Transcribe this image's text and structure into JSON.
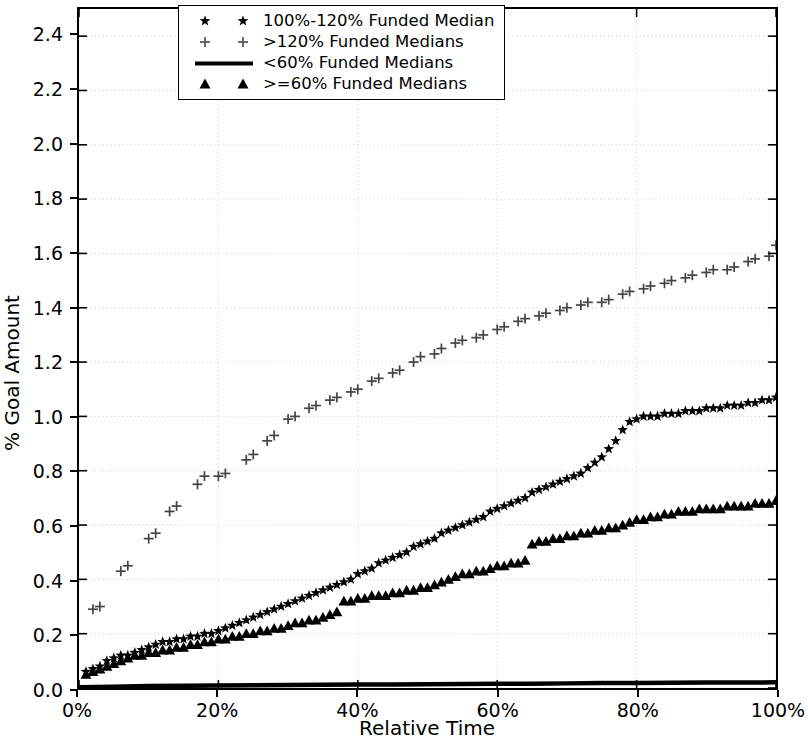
{
  "figure": {
    "width": 808,
    "height": 745,
    "background": "#ffffff",
    "foreground": "#000000",
    "grid_color": "#cccccc"
  },
  "axes": {
    "ylabel": "% Goal Amount",
    "xlabel": "Relative Time",
    "yticks": [
      "0.0",
      "0.2",
      "0.4",
      "0.6",
      "0.8",
      "1.0",
      "1.2",
      "1.4",
      "1.6",
      "1.8",
      "2.0",
      "2.2",
      "2.4"
    ],
    "ytick_values": [
      0.0,
      0.2,
      0.4,
      0.6,
      0.8,
      1.0,
      1.2,
      1.4,
      1.6,
      1.8,
      2.0,
      2.2,
      2.4
    ],
    "xticks": [
      "0%",
      "20%",
      "40%",
      "60%",
      "80%",
      "100%"
    ],
    "xtick_values": [
      0,
      20,
      40,
      60,
      80,
      100
    ],
    "ylim": [
      0.0,
      2.5
    ],
    "xlim": [
      0,
      100
    ]
  },
  "legend": {
    "position": "upper center",
    "border_color": "#000000",
    "entries": [
      {
        "label": "100%-120% Funded Median",
        "marker": "star",
        "numpoints": 2
      },
      {
        "label": ">120% Funded Medians",
        "marker": "plus",
        "numpoints": 2
      },
      {
        "label": "<60% Funded Medians",
        "marker": "line",
        "numpoints": 1
      },
      {
        "label": ">=60% Funded Medians",
        "marker": "triangle",
        "numpoints": 2
      }
    ]
  },
  "chart_data": {
    "type": "scatter",
    "title": "",
    "xlabel": "Relative Time",
    "ylabel": "% Goal Amount",
    "xlim": [
      0,
      100
    ],
    "ylim": [
      0.0,
      2.5
    ],
    "grid": true,
    "legend_position": "upper center",
    "series": [
      {
        "name": "100%-120% Funded Median",
        "marker": "star",
        "color": "#000000",
        "x": [
          1,
          2,
          3,
          4,
          5,
          6,
          7,
          8,
          9,
          10,
          11,
          12,
          13,
          14,
          15,
          16,
          17,
          18,
          19,
          20,
          21,
          22,
          23,
          24,
          25,
          26,
          27,
          28,
          29,
          30,
          31,
          32,
          33,
          34,
          35,
          36,
          37,
          38,
          39,
          40,
          41,
          42,
          43,
          44,
          45,
          46,
          47,
          48,
          49,
          50,
          51,
          52,
          53,
          54,
          55,
          56,
          57,
          58,
          59,
          60,
          61,
          62,
          63,
          64,
          65,
          66,
          67,
          68,
          69,
          70,
          71,
          72,
          73,
          74,
          75,
          76,
          77,
          78,
          79,
          80,
          81,
          82,
          83,
          84,
          85,
          86,
          87,
          88,
          89,
          90,
          91,
          92,
          93,
          94,
          95,
          96,
          97,
          98,
          99,
          100
        ],
        "y": [
          0.06,
          0.07,
          0.08,
          0.1,
          0.11,
          0.12,
          0.12,
          0.13,
          0.14,
          0.15,
          0.16,
          0.17,
          0.17,
          0.18,
          0.18,
          0.19,
          0.19,
          0.2,
          0.2,
          0.21,
          0.22,
          0.23,
          0.24,
          0.25,
          0.26,
          0.27,
          0.28,
          0.29,
          0.3,
          0.31,
          0.32,
          0.33,
          0.34,
          0.35,
          0.36,
          0.37,
          0.38,
          0.39,
          0.4,
          0.42,
          0.43,
          0.44,
          0.46,
          0.47,
          0.48,
          0.49,
          0.5,
          0.52,
          0.53,
          0.54,
          0.55,
          0.57,
          0.58,
          0.59,
          0.6,
          0.61,
          0.62,
          0.63,
          0.65,
          0.66,
          0.67,
          0.68,
          0.69,
          0.7,
          0.72,
          0.73,
          0.74,
          0.75,
          0.76,
          0.77,
          0.78,
          0.79,
          0.81,
          0.83,
          0.85,
          0.88,
          0.91,
          0.95,
          0.98,
          0.99,
          1.0,
          1.0,
          1.0,
          1.01,
          1.01,
          1.01,
          1.02,
          1.02,
          1.02,
          1.03,
          1.03,
          1.03,
          1.04,
          1.04,
          1.04,
          1.05,
          1.05,
          1.06,
          1.06,
          1.07
        ]
      },
      {
        "name": ">120% Funded Medians",
        "marker": "plus",
        "color": "#444444",
        "x": [
          2,
          3,
          6,
          7,
          10,
          11,
          13,
          14,
          17,
          18,
          20,
          21,
          24,
          25,
          27,
          28,
          30,
          31,
          33,
          34,
          36,
          37,
          39,
          40,
          42,
          43,
          45,
          46,
          48,
          49,
          51,
          52,
          54,
          55,
          57,
          58,
          60,
          61,
          63,
          64,
          66,
          67,
          69,
          70,
          72,
          73,
          75,
          76,
          78,
          79,
          81,
          82,
          84,
          85,
          87,
          88,
          90,
          91,
          93,
          94,
          96,
          97,
          99,
          100
        ],
        "y": [
          0.29,
          0.3,
          0.43,
          0.45,
          0.55,
          0.57,
          0.65,
          0.67,
          0.75,
          0.78,
          0.78,
          0.79,
          0.84,
          0.86,
          0.91,
          0.93,
          0.99,
          1.0,
          1.03,
          1.04,
          1.06,
          1.07,
          1.09,
          1.1,
          1.13,
          1.14,
          1.16,
          1.17,
          1.2,
          1.22,
          1.23,
          1.25,
          1.27,
          1.28,
          1.29,
          1.3,
          1.32,
          1.33,
          1.35,
          1.36,
          1.37,
          1.38,
          1.39,
          1.4,
          1.41,
          1.42,
          1.42,
          1.43,
          1.45,
          1.46,
          1.47,
          1.48,
          1.49,
          1.5,
          1.51,
          1.52,
          1.53,
          1.54,
          1.54,
          1.55,
          1.57,
          1.58,
          1.59,
          1.63
        ]
      },
      {
        "name": "<60% Funded Medians",
        "marker": "line",
        "color": "#000000",
        "x": [
          0,
          5,
          10,
          15,
          20,
          25,
          30,
          35,
          40,
          45,
          50,
          55,
          60,
          65,
          70,
          75,
          80,
          85,
          90,
          95,
          100
        ],
        "y": [
          0.003,
          0.005,
          0.007,
          0.008,
          0.009,
          0.01,
          0.011,
          0.012,
          0.013,
          0.013,
          0.014,
          0.015,
          0.016,
          0.016,
          0.017,
          0.018,
          0.018,
          0.019,
          0.02,
          0.02,
          0.021
        ]
      },
      {
        "name": ">=60% Funded Medians",
        "marker": "triangle",
        "color": "#000000",
        "x": [
          1,
          2,
          3,
          4,
          5,
          6,
          7,
          8,
          9,
          10,
          11,
          12,
          13,
          14,
          15,
          16,
          17,
          18,
          19,
          20,
          21,
          22,
          23,
          24,
          25,
          26,
          27,
          28,
          29,
          30,
          31,
          32,
          33,
          34,
          35,
          36,
          37,
          38,
          39,
          40,
          41,
          42,
          43,
          44,
          45,
          46,
          47,
          48,
          49,
          50,
          51,
          52,
          53,
          54,
          55,
          56,
          57,
          58,
          59,
          60,
          61,
          62,
          63,
          64,
          65,
          66,
          67,
          68,
          69,
          70,
          71,
          72,
          73,
          74,
          75,
          76,
          77,
          78,
          79,
          80,
          81,
          82,
          83,
          84,
          85,
          86,
          87,
          88,
          89,
          90,
          91,
          92,
          93,
          94,
          95,
          96,
          97,
          98,
          99,
          100
        ],
        "y": [
          0.05,
          0.06,
          0.07,
          0.08,
          0.09,
          0.1,
          0.11,
          0.12,
          0.12,
          0.13,
          0.13,
          0.14,
          0.14,
          0.15,
          0.15,
          0.16,
          0.16,
          0.17,
          0.17,
          0.18,
          0.18,
          0.19,
          0.19,
          0.2,
          0.2,
          0.21,
          0.21,
          0.22,
          0.22,
          0.23,
          0.24,
          0.24,
          0.25,
          0.25,
          0.26,
          0.27,
          0.28,
          0.32,
          0.32,
          0.33,
          0.33,
          0.34,
          0.34,
          0.34,
          0.35,
          0.35,
          0.36,
          0.36,
          0.37,
          0.37,
          0.38,
          0.39,
          0.4,
          0.41,
          0.42,
          0.42,
          0.43,
          0.43,
          0.44,
          0.45,
          0.45,
          0.46,
          0.46,
          0.47,
          0.53,
          0.54,
          0.54,
          0.55,
          0.55,
          0.56,
          0.56,
          0.57,
          0.57,
          0.58,
          0.58,
          0.59,
          0.59,
          0.6,
          0.61,
          0.62,
          0.62,
          0.63,
          0.63,
          0.64,
          0.64,
          0.65,
          0.65,
          0.65,
          0.66,
          0.66,
          0.66,
          0.66,
          0.67,
          0.67,
          0.67,
          0.67,
          0.68,
          0.68,
          0.68,
          0.69
        ]
      }
    ]
  }
}
